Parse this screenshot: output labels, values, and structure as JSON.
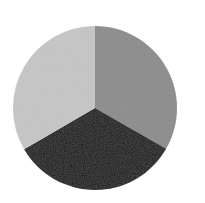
{
  "chart_data": {
    "type": "pie",
    "title": "",
    "categories": [
      "Slice A",
      "Slice B",
      "Slice C"
    ],
    "values": [
      33.3,
      33.3,
      33.4
    ],
    "colors": [
      "#8c8c8c",
      "#1f1f1f",
      "#c6c6c6"
    ],
    "start_angle_deg": -90,
    "direction": "clockwise",
    "legend": "none",
    "labels_visible": false,
    "geometry": {
      "cx": 95,
      "cy": 108,
      "r": 82
    }
  }
}
